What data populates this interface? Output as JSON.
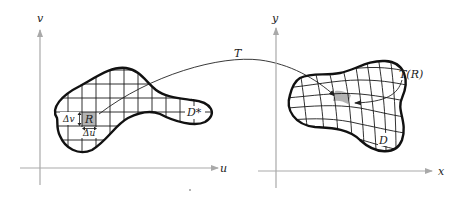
{
  "figure": {
    "left_panel": {
      "vertical_axis_label": "v",
      "horizontal_axis_label": "u",
      "region_label": "D*",
      "cell_label": "R",
      "delta_v_label": "Δv",
      "delta_u_label": "Δu"
    },
    "mapping_label": "T",
    "right_panel": {
      "vertical_axis_label": "y",
      "horizontal_axis_label": "x",
      "region_label": "D",
      "image_cell_label": "T(R)"
    },
    "colors": {
      "axis": "#a9a9a9",
      "outline": "#111111",
      "shaded_cell": "#b3b3b3",
      "background": "#ffffff"
    }
  }
}
